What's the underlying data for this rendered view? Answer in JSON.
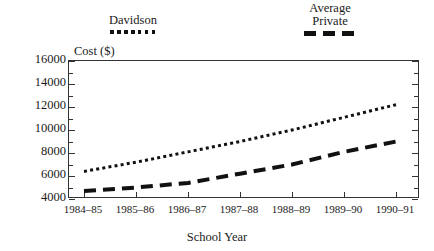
{
  "chart_data": {
    "type": "line",
    "title": "",
    "xlabel": "School Year",
    "ylabel": "Cost ($)",
    "categories": [
      "1984–85",
      "1985–86",
      "1986–87",
      "1987–88",
      "1988–89",
      "1989–90",
      "1990–91"
    ],
    "ylim": [
      4000,
      16000
    ],
    "ytick_step": 2000,
    "yticks": [
      4000,
      6000,
      8000,
      10000,
      12000,
      14000,
      16000
    ],
    "ytick_labels": [
      "4000",
      "6000",
      "8000",
      "10000",
      "12000",
      "14000",
      "16000"
    ],
    "minor_ytick_step": 1000,
    "grid": false,
    "legend_position": "above-plot",
    "series": [
      {
        "name": "Davidson",
        "style": "dotted",
        "color": "#111111",
        "values": [
          6400,
          7200,
          8100,
          9000,
          10000,
          11100,
          12200
        ]
      },
      {
        "name": "Average Private",
        "style": "dashed",
        "color": "#111111",
        "values": [
          4700,
          5000,
          5400,
          6200,
          7000,
          8100,
          9000
        ]
      }
    ]
  },
  "legend": {
    "davidson": {
      "label": "Davidson",
      "swatch": "dotted-line-swatch"
    },
    "private": {
      "line1": "Average",
      "line2": "Private",
      "swatch": "dashed-line-swatch"
    }
  },
  "axes": {
    "y_title": "Cost ($)",
    "x_title": "School Year"
  }
}
